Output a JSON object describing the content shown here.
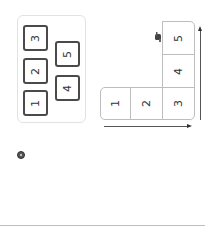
{
  "left_panel": {
    "tiles": [
      {
        "label": "1"
      },
      {
        "label": "2"
      },
      {
        "label": "3"
      },
      {
        "label": "4"
      },
      {
        "label": "5"
      }
    ]
  },
  "grid": {
    "cells": [
      {
        "label": "1"
      },
      {
        "label": "2"
      },
      {
        "label": "3"
      },
      {
        "label": "4"
      },
      {
        "label": "5"
      }
    ]
  },
  "icons": {
    "cursor": "hand-cursor-icon",
    "badge": "record-icon"
  },
  "colors": {
    "tile_border": "#4a4a4a",
    "cell_border": "#bdbdbd",
    "panel_border": "#e2e2e2"
  }
}
